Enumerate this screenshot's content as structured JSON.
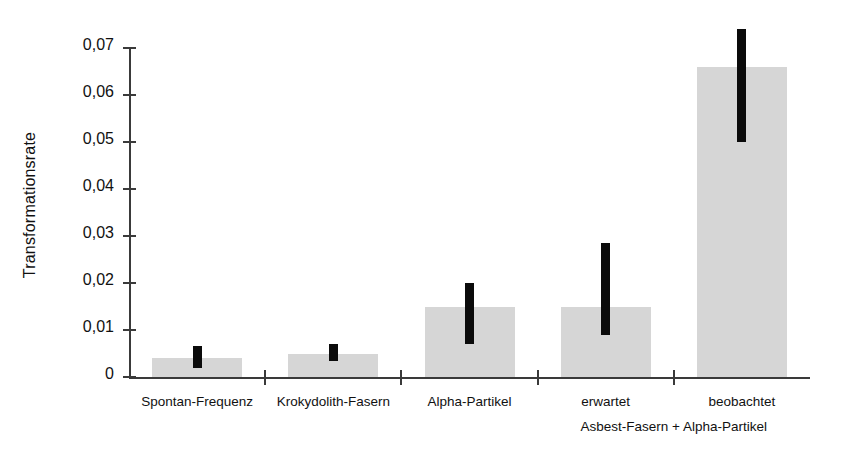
{
  "chart_data": {
    "type": "bar",
    "title": "",
    "xlabel": "",
    "ylabel": "Transformationsrate",
    "categories": [
      "Spontan-Frequenz",
      "Krokydolith-Fasern",
      "Alpha-Partikel",
      "erwartet",
      "beobachtet"
    ],
    "values": [
      0.004,
      0.005,
      0.015,
      0.015,
      0.066
    ],
    "errors_low": [
      0.002,
      0.0035,
      0.007,
      0.009,
      0.05
    ],
    "errors_high": [
      0.0065,
      0.007,
      0.02,
      0.0285,
      0.074
    ],
    "ylim": [
      0,
      0.07
    ],
    "ytick_values": [
      0,
      0.01,
      0.02,
      0.03,
      0.04,
      0.05,
      0.06,
      0.07
    ],
    "ytick_labels": [
      "0",
      "0,01",
      "0,02",
      "0,03",
      "0,04",
      "0,05",
      "0,06",
      "0,07"
    ],
    "grid": false,
    "legend": "none",
    "group_label": "Asbest-Fasern + Alpha-Partikel",
    "group_label_categories": [
      "erwartet",
      "beobachtet"
    ],
    "bar_color": "#d6d6d6",
    "error_color": "#0b0b0b",
    "axis_color": "#3a3a3a",
    "background": "#ffffff"
  }
}
